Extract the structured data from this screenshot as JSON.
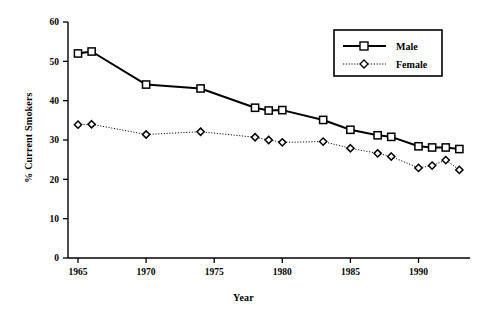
{
  "chart_data": {
    "type": "line",
    "title": "",
    "xlabel": "Year",
    "ylabel": "% Current Smokers",
    "xlim": [
      1964,
      1994
    ],
    "ylim": [
      0,
      60
    ],
    "grid": false,
    "legend_position": "top-right",
    "xticks": [
      1965,
      1970,
      1975,
      1980,
      1985,
      1990
    ],
    "xtick_labels": [
      "1965",
      "1970",
      "1975",
      "1980",
      "1985",
      "1990"
    ],
    "yticks": [
      0,
      10,
      20,
      30,
      40,
      50,
      60
    ],
    "ytick_labels": [
      "0",
      "10",
      "20",
      "30",
      "40",
      "50",
      "60"
    ],
    "series": [
      {
        "name": "Male",
        "marker": "open-square",
        "line_style": "solid",
        "line_width": 2,
        "color": "#000000",
        "x": [
          1965,
          1966,
          1970,
          1974,
          1978,
          1979,
          1980,
          1983,
          1985,
          1987,
          1988,
          1990,
          1991,
          1992,
          1993
        ],
        "values": [
          52.0,
          52.5,
          44.1,
          43.1,
          38.2,
          37.5,
          37.6,
          35.1,
          32.6,
          31.2,
          30.8,
          28.4,
          28.1,
          28.1,
          27.7
        ]
      },
      {
        "name": "Female",
        "marker": "open-diamond",
        "line_style": "dotted",
        "line_width": 1,
        "color": "#000000",
        "x": [
          1965,
          1966,
          1970,
          1974,
          1978,
          1979,
          1980,
          1983,
          1985,
          1987,
          1988,
          1990,
          1991,
          1992,
          1993
        ],
        "values": [
          33.9,
          34.0,
          31.4,
          32.1,
          30.7,
          30.0,
          29.4,
          29.6,
          27.9,
          26.6,
          25.8,
          22.9,
          23.5,
          24.9,
          22.4
        ]
      }
    ]
  },
  "legend": {
    "entries": [
      {
        "label": "Male"
      },
      {
        "label": "Female"
      }
    ]
  }
}
